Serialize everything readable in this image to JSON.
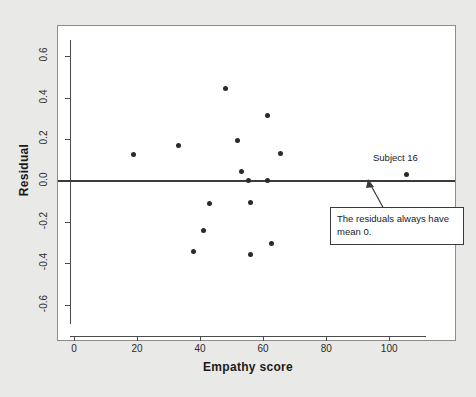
{
  "chart_data": {
    "type": "scatter",
    "title": "",
    "xlabel": "Empathy score",
    "ylabel": "Residual",
    "xlim": [
      -4,
      117
    ],
    "ylim": [
      -0.73,
      0.73
    ],
    "xticks": [
      "0",
      "20",
      "40",
      "60",
      "80",
      "100"
    ],
    "xtick_values": [
      0,
      20,
      40,
      60,
      80,
      100
    ],
    "yticks": [
      "0.6",
      "0.4",
      "0.2",
      "0.0",
      "-0.2",
      "-0.4",
      "-0.6"
    ],
    "ytick_values": [
      0.6,
      0.4,
      0.2,
      0.0,
      -0.2,
      -0.4,
      -0.6
    ],
    "grid": false,
    "legend": "none",
    "reference_line": {
      "y": 0.0,
      "style": "solid",
      "color": "#3a3a3a"
    },
    "points": [
      {
        "x": 19,
        "y": 0.125
      },
      {
        "x": 33,
        "y": 0.17
      },
      {
        "x": 38,
        "y": -0.345
      },
      {
        "x": 41,
        "y": -0.24
      },
      {
        "x": 43,
        "y": -0.11
      },
      {
        "x": 48,
        "y": 0.445
      },
      {
        "x": 52,
        "y": 0.195
      },
      {
        "x": 53,
        "y": 0.045
      },
      {
        "x": 55.5,
        "y": 0.0
      },
      {
        "x": 56,
        "y": -0.105
      },
      {
        "x": 56,
        "y": -0.355
      },
      {
        "x": 61.5,
        "y": 0.0
      },
      {
        "x": 61.5,
        "y": 0.315
      },
      {
        "x": 62.5,
        "y": -0.305
      },
      {
        "x": 65.5,
        "y": 0.13
      },
      {
        "x": 105.5,
        "y": 0.03
      }
    ],
    "annotations": [
      {
        "name": "subject-16-label",
        "text": "Subject 16",
        "type": "point-label"
      },
      {
        "name": "mean-zero-callout",
        "text": "The residuals always have mean 0.",
        "type": "callout-box",
        "points_to": {
          "x": 92,
          "y": -0.015
        }
      }
    ],
    "colors": {
      "point": "#2a2a2a",
      "reference_line": "#3a3a3a",
      "panel_background": "#ffffff",
      "figure_background": "#e9e9e7",
      "axis": "#4a4a4a"
    }
  }
}
